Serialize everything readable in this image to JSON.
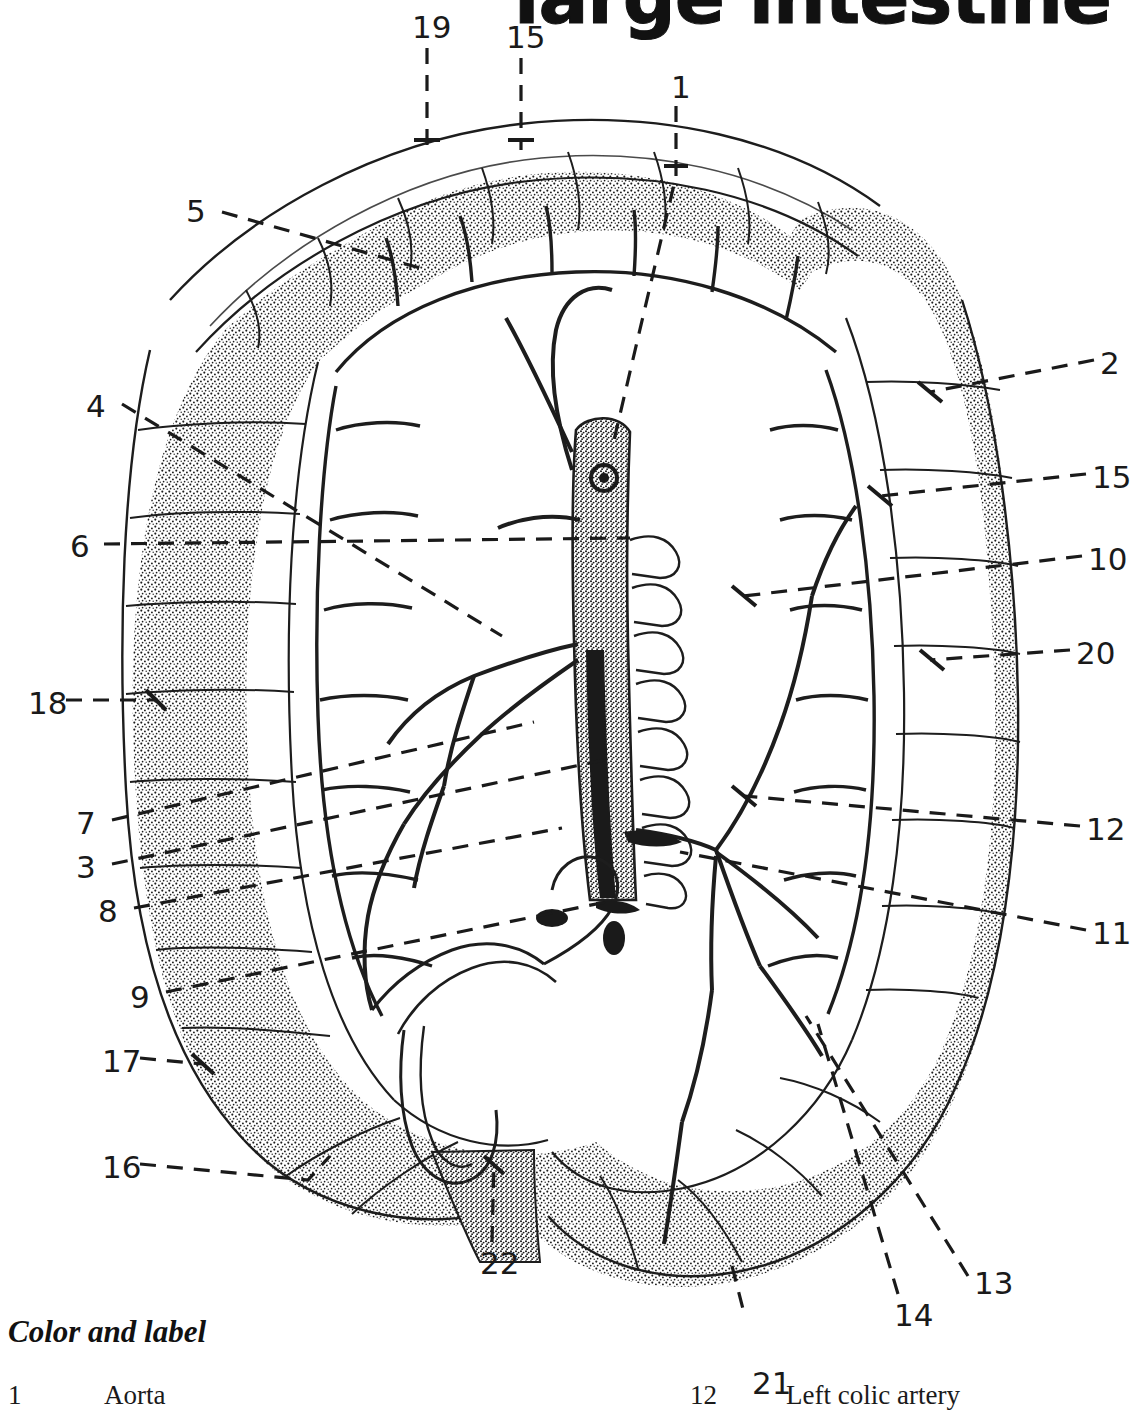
{
  "page": {
    "title": "large intestine",
    "background_color": "#ffffff",
    "ink_color": "#1a1a1a"
  },
  "illustration": {
    "subject": "arterial-supply-of-large-intestine",
    "style": "stippled-line-drawing",
    "description": "Anterior view of the large intestine with mesenteric arterial arcade, aorta and branches"
  },
  "leader_labels": [
    {
      "number": "19",
      "x": 412,
      "y": 12,
      "anchor_x": 427,
      "anchor_y": 150,
      "side": "top"
    },
    {
      "number": "15",
      "x": 506,
      "y": 22,
      "anchor_x": 521,
      "anchor_y": 150,
      "side": "top"
    },
    {
      "number": "1",
      "x": 671,
      "y": 72,
      "anchor_x": 614,
      "anchor_y": 440,
      "side": "top"
    },
    {
      "number": "5",
      "x": 186,
      "y": 196,
      "anchor_x": 420,
      "anchor_y": 262,
      "side": "left"
    },
    {
      "number": "4",
      "x": 86,
      "y": 391,
      "anchor_x": 500,
      "anchor_y": 640,
      "side": "left"
    },
    {
      "number": "6",
      "x": 70,
      "y": 531,
      "anchor_x": 628,
      "anchor_y": 536,
      "side": "left"
    },
    {
      "number": "18",
      "x": 28,
      "y": 688,
      "anchor_x": 150,
      "anchor_y": 700,
      "side": "left"
    },
    {
      "number": "7",
      "x": 76,
      "y": 808,
      "anchor_x": 530,
      "anchor_y": 718,
      "side": "left"
    },
    {
      "number": "3",
      "x": 76,
      "y": 852,
      "anchor_x": 600,
      "anchor_y": 760,
      "side": "left"
    },
    {
      "number": "8",
      "x": 98,
      "y": 896,
      "anchor_x": 560,
      "anchor_y": 826,
      "side": "left"
    },
    {
      "number": "9",
      "x": 130,
      "y": 982,
      "anchor_x": 600,
      "anchor_y": 900,
      "side": "left"
    },
    {
      "number": "17",
      "x": 102,
      "y": 1046,
      "anchor_x": 196,
      "anchor_y": 1062,
      "side": "left"
    },
    {
      "number": "16",
      "x": 102,
      "y": 1152,
      "anchor_x": 320,
      "anchor_y": 1168,
      "side": "left"
    },
    {
      "number": "2",
      "x": 1100,
      "y": 348,
      "anchor_x": 930,
      "anchor_y": 388,
      "side": "right"
    },
    {
      "number": "15",
      "x": 1092,
      "y": 462,
      "anchor_x": 880,
      "anchor_y": 492,
      "side": "right"
    },
    {
      "number": "10",
      "x": 1088,
      "y": 544,
      "anchor_x": 742,
      "anchor_y": 592,
      "side": "right"
    },
    {
      "number": "20",
      "x": 1076,
      "y": 638,
      "anchor_x": 932,
      "anchor_y": 658,
      "side": "right"
    },
    {
      "number": "12",
      "x": 1086,
      "y": 814,
      "anchor_x": 742,
      "anchor_y": 792,
      "side": "right"
    },
    {
      "number": "11",
      "x": 1092,
      "y": 918,
      "anchor_x": 676,
      "anchor_y": 848,
      "side": "right"
    },
    {
      "number": "13",
      "x": 974,
      "y": 1268,
      "anchor_x": 800,
      "anchor_y": 1010,
      "side": "bottom"
    },
    {
      "number": "14",
      "x": 894,
      "y": 1300,
      "anchor_x": 812,
      "anchor_y": 1018,
      "side": "bottom"
    },
    {
      "number": "21",
      "x": 752,
      "y": 1368,
      "anchor_x": 730,
      "anchor_y": 1262,
      "side": "bottom"
    },
    {
      "number": "22",
      "x": 480,
      "y": 1248,
      "anchor_x": 492,
      "anchor_y": 1160,
      "side": "bottom"
    }
  ],
  "legend": {
    "heading": "Color and label",
    "left_column": [
      {
        "number": "1",
        "label": "Aorta"
      }
    ],
    "right_column": [
      {
        "number": "12",
        "label": "Left colic artery"
      }
    ]
  }
}
